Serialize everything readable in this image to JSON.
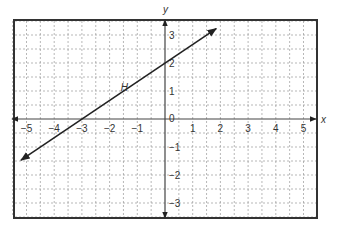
{
  "chart_data": {
    "type": "line",
    "title": "",
    "xlabel": "x",
    "ylabel": "y",
    "xlim": [
      -5.5,
      5.5
    ],
    "ylim": [
      -3.5,
      3.5
    ],
    "x_ticks": [
      -5,
      -4,
      -3,
      -2,
      -1,
      1,
      2,
      3,
      4,
      5
    ],
    "x_tick_labels": [
      "−5",
      "−4",
      "−3",
      "−2",
      "−1",
      "1",
      "2",
      "3",
      "4",
      "5"
    ],
    "y_ticks": [
      3,
      2,
      1,
      -1,
      -2,
      -3
    ],
    "y_tick_labels": [
      "3",
      "2",
      "1",
      "−1",
      "−2",
      "−3"
    ],
    "origin_label": "0",
    "grid": true,
    "grid_step": 0.5,
    "grid_style": "dashed",
    "series": [
      {
        "name": "H",
        "equation": "y = (2/3)x + 2",
        "slope": 0.6667,
        "y_intercept": 2,
        "x_intercept": -3,
        "x": [
          -5.2,
          1.85
        ],
        "y": [
          -1.47,
          3.23
        ],
        "arrows": "both",
        "label_position": [
          -1.6,
          1.0
        ]
      }
    ]
  },
  "colors": {
    "frame": "#333333",
    "grid": "#9a9a9a",
    "axis": "#444444",
    "line": "#222222",
    "text": "#333333"
  }
}
